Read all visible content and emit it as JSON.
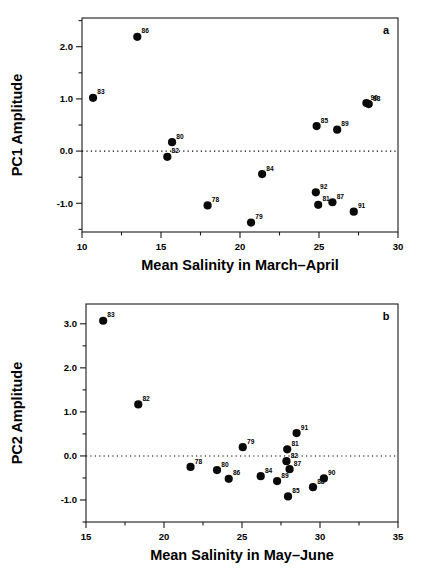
{
  "figure": {
    "background": "#ffffff",
    "marker_color": "#0a0a0a",
    "axis_color": "#1a1a1a"
  },
  "chart_data": [
    {
      "type": "scatter",
      "panel_label": "a",
      "title": "",
      "xlabel": "Mean Salinity in March–April",
      "ylabel": "PC1 Amplitude",
      "xlim": [
        10,
        30
      ],
      "ylim": [
        -1.55,
        2.55
      ],
      "xticks": [
        10,
        15,
        20,
        25,
        30
      ],
      "xticklabels": [
        "10",
        "15",
        "20",
        "25",
        "30"
      ],
      "xminorticks": [
        12.5,
        17.5,
        22.5,
        27.5
      ],
      "yticks": [
        -1.0,
        0.0,
        1.0,
        2.0
      ],
      "yticklabels": [
        "-1.0",
        "0.0",
        "1.0",
        "2.0"
      ],
      "yminorticks": [
        -1.5,
        -0.5,
        0.5,
        1.5,
        2.5
      ],
      "grid": false,
      "zero_line": 0.0,
      "legend": "none",
      "points": [
        {
          "label": "83",
          "x": 10.7,
          "y": 1.02
        },
        {
          "label": "86",
          "x": 13.5,
          "y": 2.19
        },
        {
          "label": "80",
          "x": 15.7,
          "y": 0.17
        },
        {
          "label": "82",
          "x": 15.4,
          "y": -0.11
        },
        {
          "label": "78",
          "x": 17.95,
          "y": -1.04
        },
        {
          "label": "79",
          "x": 20.7,
          "y": -1.37
        },
        {
          "label": "84",
          "x": 21.4,
          "y": -0.44
        },
        {
          "label": "92",
          "x": 24.8,
          "y": -0.79
        },
        {
          "label": "81",
          "x": 24.95,
          "y": -1.03
        },
        {
          "label": "85",
          "x": 24.85,
          "y": 0.48
        },
        {
          "label": "87",
          "x": 25.85,
          "y": -0.98
        },
        {
          "label": "89",
          "x": 26.15,
          "y": 0.41
        },
        {
          "label": "91",
          "x": 27.2,
          "y": -1.16
        },
        {
          "label": "90",
          "x": 28.0,
          "y": 0.92
        },
        {
          "label": "88",
          "x": 28.15,
          "y": 0.9
        }
      ]
    },
    {
      "type": "scatter",
      "panel_label": "b",
      "title": "",
      "xlabel": "Mean Salinity in May–June",
      "ylabel": "PC2 Amplitude",
      "xlim": [
        15,
        35
      ],
      "ylim": [
        -1.5,
        3.45
      ],
      "xticks": [
        15,
        20,
        25,
        30,
        35
      ],
      "xticklabels": [
        "15",
        "20",
        "25",
        "30",
        "35"
      ],
      "xminorticks": [
        17.5,
        22.5,
        27.5,
        32.5
      ],
      "yticks": [
        -1.0,
        0.0,
        1.0,
        2.0,
        3.0
      ],
      "yticklabels": [
        "-1.0",
        "0.0",
        "1.0",
        "2.0",
        "3.0"
      ],
      "yminorticks": [
        -1.5,
        -0.5,
        0.5,
        1.5,
        2.5,
        3.5
      ],
      "grid": false,
      "zero_line": 0.0,
      "legend": "none",
      "points": [
        {
          "label": "83",
          "x": 16.1,
          "y": 3.07
        },
        {
          "label": "82",
          "x": 18.35,
          "y": 1.17
        },
        {
          "label": "78",
          "x": 21.7,
          "y": -0.25
        },
        {
          "label": "80",
          "x": 23.4,
          "y": -0.32
        },
        {
          "label": "86",
          "x": 24.15,
          "y": -0.52
        },
        {
          "label": "79",
          "x": 25.05,
          "y": 0.2
        },
        {
          "label": "84",
          "x": 26.2,
          "y": -0.46
        },
        {
          "label": "89",
          "x": 27.25,
          "y": -0.57
        },
        {
          "label": "82b",
          "x": 27.85,
          "y": -0.12
        },
        {
          "label": "81",
          "x": 27.9,
          "y": 0.15
        },
        {
          "label": "87",
          "x": 28.05,
          "y": -0.3
        },
        {
          "label": "85",
          "x": 27.95,
          "y": -0.92
        },
        {
          "label": "91",
          "x": 28.5,
          "y": 0.52
        },
        {
          "label": "88",
          "x": 29.55,
          "y": -0.71
        },
        {
          "label": "90",
          "x": 30.25,
          "y": -0.51
        }
      ]
    }
  ]
}
